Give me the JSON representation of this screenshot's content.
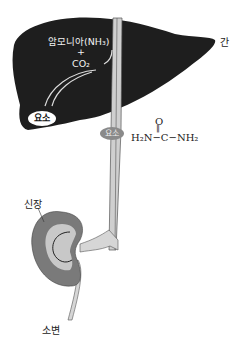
{
  "labels": {
    "liver": "간",
    "kidney": "신장",
    "urine": "소변"
  },
  "liver_reaction": {
    "ammonia": "암모니아(NH₃)",
    "plus": "+",
    "co2": "CO₂",
    "product": "요소"
  },
  "blood_vessel": {
    "urea_label": "요소"
  },
  "urea_formula": {
    "top": "O",
    "double_bond": "‖",
    "main": "H₂N−C−NH₂"
  },
  "colors": {
    "liver": "#1e1e1e",
    "vessel": "#cfcfcf",
    "kidney_outer": "#7a7a7a",
    "kidney_inner": "#c8c8c8"
  }
}
